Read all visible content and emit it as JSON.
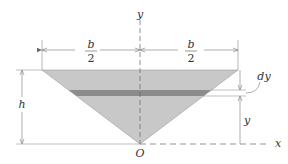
{
  "diagram": {
    "labels": {
      "y_axis": "y",
      "x_axis": "x",
      "origin": "O",
      "half_width_left_num": "b",
      "half_width_left_den": "2",
      "half_width_right_num": "b",
      "half_width_right_den": "2",
      "height": "h",
      "strip_thickness": "dy",
      "strip_height": "y"
    },
    "colors": {
      "triangle_fill": "#c8c8c8",
      "strip_fill": "#8c8c8c",
      "line": "#666666",
      "text": "#333333"
    }
  }
}
